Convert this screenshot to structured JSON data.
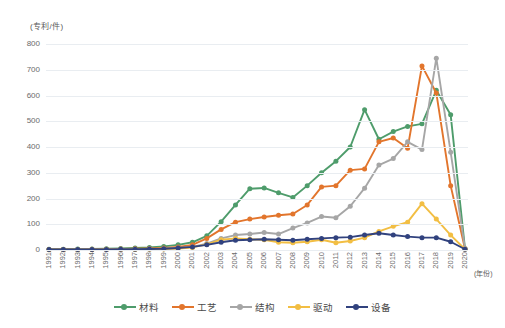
{
  "chart_data": {
    "type": "line",
    "title": "",
    "ylabel": "(专利/件)",
    "xlabel": "(年份)",
    "ylim": [
      0,
      800
    ],
    "ytick_step": 100,
    "yticks": [
      "800",
      "700",
      "600",
      "500",
      "400",
      "300",
      "200",
      "100",
      "0"
    ],
    "grid": true,
    "legend_position": "bottom",
    "categories": [
      "1991",
      "1992",
      "1993",
      "1994",
      "1995",
      "1996",
      "1997",
      "1998",
      "1999",
      "2000",
      "2001",
      "2002",
      "2003",
      "2004",
      "2005",
      "2006",
      "2007",
      "2008",
      "2009",
      "2010",
      "2011",
      "2012",
      "2013",
      "2014",
      "2015",
      "2016",
      "2017",
      "2018",
      "2019",
      "2020"
    ],
    "series": [
      {
        "name": "材料",
        "color": "#4E9C6B",
        "values": [
          3,
          3,
          4,
          4,
          5,
          6,
          8,
          10,
          14,
          20,
          30,
          55,
          110,
          175,
          238,
          241,
          222,
          204,
          250,
          300,
          345,
          400,
          545,
          430,
          460,
          480,
          490,
          620,
          525,
          5
        ]
      },
      {
        "name": "工艺",
        "color": "#E2752C",
        "values": [
          2,
          2,
          2,
          3,
          3,
          4,
          5,
          6,
          8,
          12,
          20,
          45,
          80,
          108,
          120,
          128,
          135,
          140,
          175,
          245,
          250,
          310,
          315,
          420,
          435,
          395,
          715,
          610,
          250,
          5
        ]
      },
      {
        "name": "结构",
        "color": "#A6A6A6",
        "values": [
          1,
          1,
          2,
          2,
          2,
          3,
          3,
          4,
          5,
          8,
          12,
          25,
          45,
          58,
          62,
          68,
          62,
          85,
          105,
          130,
          125,
          170,
          240,
          330,
          355,
          420,
          390,
          745,
          380,
          5
        ]
      },
      {
        "name": "驱动",
        "color": "#F2BE43",
        "values": [
          1,
          1,
          1,
          1,
          2,
          2,
          2,
          3,
          4,
          6,
          10,
          22,
          40,
          45,
          42,
          40,
          30,
          28,
          32,
          40,
          28,
          35,
          48,
          72,
          92,
          108,
          180,
          120,
          58,
          3
        ]
      },
      {
        "name": "设备",
        "color": "#31427E",
        "values": [
          2,
          2,
          2,
          2,
          2,
          3,
          3,
          4,
          5,
          8,
          12,
          20,
          30,
          38,
          40,
          42,
          40,
          38,
          42,
          45,
          48,
          50,
          58,
          65,
          58,
          52,
          48,
          48,
          32,
          3
        ]
      }
    ]
  },
  "axis": {
    "y_title": "(专利/件)",
    "x_title": "(年份)"
  }
}
